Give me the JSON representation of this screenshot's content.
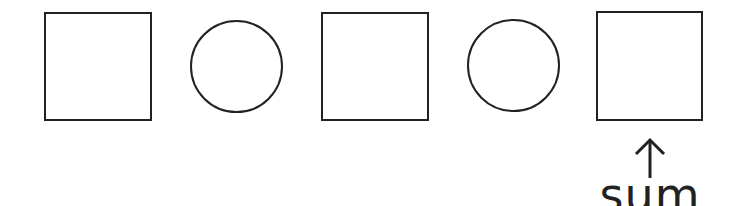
{
  "diagram": {
    "slots": [
      {
        "shape": "square",
        "role": "box"
      },
      {
        "shape": "circle",
        "role": "operator"
      },
      {
        "shape": "square",
        "role": "box"
      },
      {
        "shape": "circle",
        "role": "operator"
      },
      {
        "shape": "square",
        "role": "result"
      }
    ],
    "annotation": {
      "arrow": "up-arrow-icon",
      "label": "sum",
      "target_slot": 4
    },
    "colors": {
      "stroke": "#222222",
      "background": "#ffffff"
    }
  }
}
